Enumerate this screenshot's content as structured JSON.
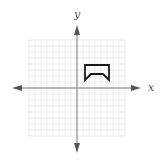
{
  "figure": {
    "x_axis_label": "x",
    "y_axis_label": "y",
    "grid": {
      "visible": true,
      "cells_per_side": 16,
      "cell_size_px": 6,
      "line_color": "#e4e4e4"
    },
    "axis_color": "#777777",
    "shape": {
      "description": "closed polygon in quadrant I, arch-like shape open at bottom",
      "stroke_color": "#1a1a1a",
      "vertices_grid_units": [
        [
          1.3,
          3.8
        ],
        [
          5.3,
          3.8
        ],
        [
          5.3,
          1.3
        ],
        [
          4.3,
          2.3
        ],
        [
          2.3,
          2.3
        ],
        [
          1.3,
          1.3
        ]
      ]
    }
  }
}
